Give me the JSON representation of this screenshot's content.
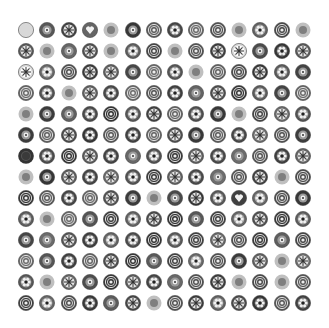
{
  "image": {
    "description": "Grayscale grid of circular millefiori-style glass bead/button patterns on white background",
    "background": "#ffffff",
    "grid": {
      "rows": 14,
      "cols": 14,
      "origin_x": 26,
      "origin_y": 30,
      "step_x": 21.3,
      "step_y": 21.0,
      "diameter": 16
    },
    "pattern_types": [
      "rings",
      "star",
      "flower",
      "dot",
      "heart",
      "blur",
      "spokes"
    ],
    "cells": [
      "ring-l",
      "dot",
      "star",
      "heart",
      "blur",
      "dot",
      "rings",
      "flower",
      "rings",
      "rings",
      "blur",
      "flower",
      "rings",
      "blur",
      "star",
      "blur",
      "dot",
      "star",
      "blur",
      "flower",
      "rings",
      "blur",
      "rings",
      "star",
      "star-l",
      "dot",
      "flower",
      "star",
      "star-l",
      "flower",
      "rings",
      "star",
      "star",
      "dot",
      "rings",
      "flower",
      "blur",
      "rings",
      "rings",
      "star",
      "flower",
      "dot",
      "rings",
      "flower",
      "blur",
      "star",
      "flower",
      "rings",
      "rings",
      "flower",
      "dot",
      "star",
      "rings",
      "flower",
      "dot",
      "rings",
      "blur",
      "dot",
      "dot",
      "flower",
      "rings",
      "flower",
      "star",
      "rings",
      "flower",
      "dot",
      "blur",
      "rings",
      "star",
      "flower",
      "dot",
      "rings",
      "star",
      "flower",
      "rings",
      "flower",
      "rings",
      "star",
      "dot",
      "rings",
      "flower",
      "star",
      "rings",
      "dot",
      "dark",
      "flower",
      "rings",
      "star",
      "flower",
      "dot",
      "flower",
      "rings",
      "star",
      "flower",
      "dot",
      "rings",
      "flower",
      "star",
      "blur",
      "dot",
      "star",
      "flower",
      "star",
      "flower",
      "rings",
      "star",
      "flower",
      "dot",
      "rings",
      "star",
      "blur",
      "rings",
      "rings",
      "rings",
      "flower",
      "rings",
      "star",
      "dot",
      "blur",
      "dot",
      "star",
      "flower",
      "heart",
      "flower",
      "rings",
      "dot",
      "flower",
      "blur",
      "rings",
      "dot",
      "rings",
      "flower",
      "star",
      "rings",
      "dot",
      "rings",
      "flower",
      "star",
      "rings",
      "flower",
      "dot",
      "dot",
      "star",
      "flower",
      "flower",
      "flower",
      "rings",
      "flower",
      "rings",
      "star",
      "rings",
      "rings",
      "dot",
      "rings",
      "rings",
      "dot",
      "flower",
      "rings",
      "star",
      "rings",
      "dot",
      "rings",
      "flower",
      "rings",
      "dot",
      "star",
      "blur",
      "star",
      "flower",
      "blur",
      "star",
      "dot",
      "rings",
      "star",
      "flower",
      "dot",
      "rings",
      "star",
      "blur",
      "rings",
      "blur",
      "rings",
      "rings",
      "flower",
      "rings",
      "flower",
      "dot",
      "star",
      "blur",
      "rings",
      "star",
      "flower",
      "star",
      "flower",
      "rings",
      "flower"
    ]
  }
}
